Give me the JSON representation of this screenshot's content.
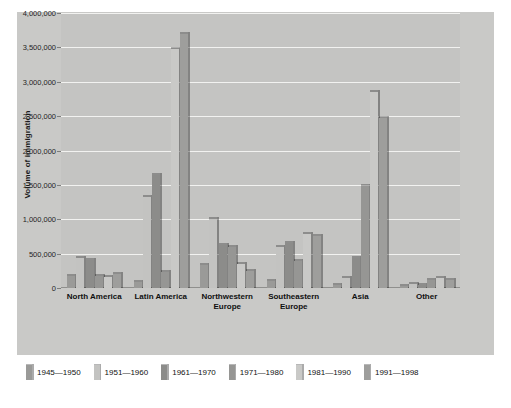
{
  "chart_data": {
    "type": "bar",
    "title": "",
    "xlabel": "",
    "ylabel": "Volume of immigration",
    "ylim": [
      0,
      4000000
    ],
    "yticks": [
      "0",
      "500,000",
      "1,000,000",
      "1,500,000",
      "2,000,000",
      "2,500,000",
      "3,000,000",
      "3,500,000",
      "4,000,000"
    ],
    "ytick_values": [
      0,
      500000,
      1000000,
      1500000,
      2000000,
      2500000,
      3000000,
      3500000,
      4000000
    ],
    "grid": true,
    "legend_position": "bottom",
    "categories": [
      "North America",
      "Latin America",
      "Northwestern Europe",
      "Southeastern Europe",
      "Asia",
      "Other"
    ],
    "series": [
      {
        "name": "1945—1950",
        "color": "#9a9a98",
        "values": [
          170000,
          90000,
          330000,
          95000,
          40000,
          25000
        ]
      },
      {
        "name": "1951—1960",
        "color": "#c3c3c1",
        "values": [
          430000,
          1330000,
          1000000,
          600000,
          150000,
          60000
        ]
      },
      {
        "name": "1961—1970",
        "color": "#8c8c8a",
        "values": [
          410000,
          1650000,
          620000,
          650000,
          430000,
          40000
        ]
      },
      {
        "name": "1971—1980",
        "color": "#969694",
        "values": [
          170000,
          230000,
          590000,
          400000,
          1480000,
          110000
        ]
      },
      {
        "name": "1981—1990",
        "color": "#c9c9c7",
        "values": [
          160000,
          3470000,
          350000,
          790000,
          2850000,
          150000
        ]
      },
      {
        "name": "1991—1998",
        "color": "#9e9e9c",
        "values": [
          210000,
          3700000,
          250000,
          760000,
          2480000,
          120000
        ]
      }
    ]
  },
  "chart": {
    "background": "#c9c9c7",
    "plot_background": "#c4c4c2",
    "gridline_color": "#f2f2f0"
  }
}
